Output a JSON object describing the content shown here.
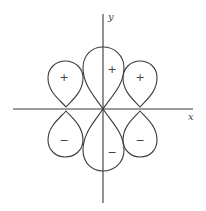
{
  "diagram": {
    "type": "orbital-lobes",
    "axes": {
      "x_label": "x",
      "y_label": "y"
    },
    "lobes": [
      {
        "position": "upper-left",
        "sign": "+"
      },
      {
        "position": "upper-center",
        "sign": "+"
      },
      {
        "position": "upper-right",
        "sign": "+"
      },
      {
        "position": "lower-left",
        "sign": "−"
      },
      {
        "position": "lower-center",
        "sign": "−"
      },
      {
        "position": "lower-right",
        "sign": "−"
      }
    ],
    "colors": {
      "line": "#3a3a3a",
      "background": "#ffffff"
    }
  }
}
